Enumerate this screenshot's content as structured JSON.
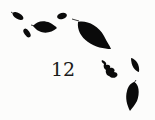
{
  "page": {
    "number": "12",
    "background_color": "#fcfcfb",
    "ink_color": "#0a0a0a"
  },
  "decoration": {
    "type": "falling-leaves",
    "leaf_count": 8
  }
}
